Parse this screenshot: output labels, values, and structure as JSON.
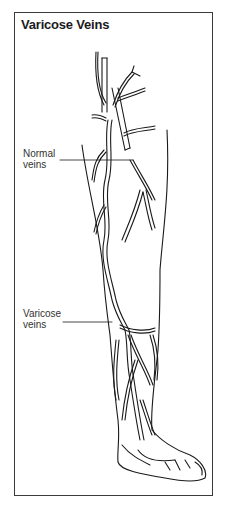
{
  "title": "Varicose Veins",
  "labels": {
    "normal": {
      "line1": "Normal",
      "line2": "veins"
    },
    "varicose": {
      "line1": "Varicose",
      "line2": "veins"
    }
  },
  "colors": {
    "stroke": "#1a1a1a",
    "frame": "#3a3a3a",
    "background": "#ffffff"
  }
}
